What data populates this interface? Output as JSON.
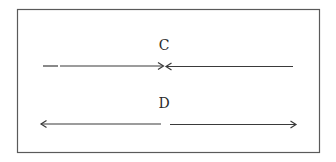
{
  "diagram": {
    "frame": {
      "x": 17,
      "y": 9,
      "width": 303,
      "height": 144,
      "stroke": "#555555"
    },
    "stroke_color": "#3a3a3a",
    "figures": [
      {
        "id": "C",
        "label": "C",
        "label_pos": {
          "x": 164,
          "y": 38
        },
        "line_y": 66,
        "description": "two arrows pointing inward meeting at the center",
        "segments": [
          {
            "x1": 43,
            "x2": 164,
            "arrowhead": "right"
          },
          {
            "x1": 166,
            "x2": 293,
            "arrowhead": "left"
          }
        ]
      },
      {
        "id": "D",
        "label": "D",
        "label_pos": {
          "x": 164,
          "y": 96
        },
        "line_y": 124,
        "description": "two arrows pointing outward with a gap at the center",
        "segments": [
          {
            "x1": 41,
            "x2": 161,
            "arrowhead": "left"
          },
          {
            "x1": 170,
            "x2": 297,
            "arrowhead": "right"
          }
        ]
      }
    ]
  }
}
